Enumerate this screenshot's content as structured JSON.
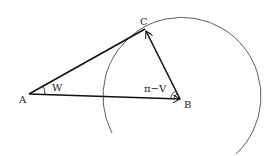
{
  "diagram": {
    "points": {
      "A": {
        "label": "A",
        "x": 29,
        "y": 94
      },
      "B": {
        "label": "B",
        "x": 180,
        "y": 99
      },
      "C": {
        "label": "C",
        "x": 145,
        "y": 29
      }
    },
    "angle_labels": {
      "at_A": "W",
      "at_B": "π−V"
    },
    "circle": {
      "center": "B",
      "radius": 79
    },
    "colors": {
      "line": "#111111",
      "circle": "#333333",
      "text": "#222222"
    }
  }
}
